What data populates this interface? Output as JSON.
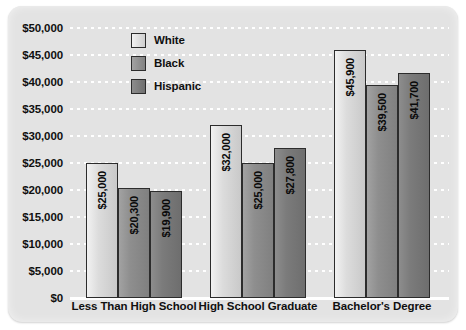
{
  "chart_data": {
    "type": "bar",
    "title": "",
    "xlabel": "",
    "ylabel": "",
    "grid": true,
    "legend_position": "top-left-inside",
    "categories": [
      "Less Than High School",
      "High School Graduate",
      "Bachelor's Degree"
    ],
    "series": [
      {
        "name": "White",
        "color": "#dcdcdc",
        "values": [
          25000,
          32000,
          45900
        ],
        "labels": [
          "$25,000",
          "$32,000",
          "$45,900"
        ]
      },
      {
        "name": "Black",
        "color": "#8e8e8e",
        "values": [
          20300,
          25000,
          39500
        ],
        "labels": [
          "$20,300",
          "$25,000",
          "$39,500"
        ]
      },
      {
        "name": "Hispanic",
        "color": "#7b7b7b",
        "values": [
          19900,
          27800,
          41700
        ],
        "labels": [
          "$19,900",
          "$27,800",
          "$41,700"
        ]
      }
    ],
    "ylim": [
      0,
      50000
    ],
    "ytick_values": [
      0,
      5000,
      10000,
      15000,
      20000,
      25000,
      30000,
      35000,
      40000,
      45000,
      50000
    ],
    "ytick_labels": [
      "$0",
      "$5,000",
      "$10,000",
      "$15,000",
      "$20,000",
      "$25,000",
      "$30,000",
      "$35,000",
      "$40,000",
      "$45,000",
      "$50,000"
    ],
    "colors": {
      "plot_background": "#e3e3e3",
      "gridline": "#ffffff",
      "axis": "#ffffff",
      "bar_border": "#2c2c2c",
      "text": "#101010"
    }
  }
}
